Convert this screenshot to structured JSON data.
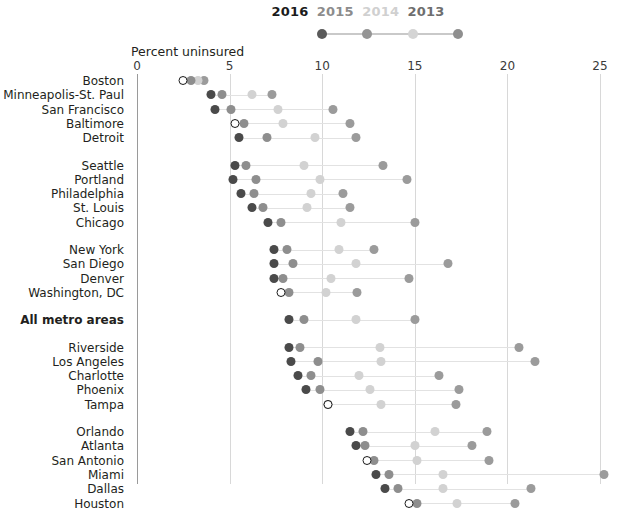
{
  "axis": {
    "title": "Percent uninsured",
    "ticks": [
      0,
      5,
      10,
      15,
      20,
      25
    ],
    "tick_labels": [
      "0",
      "5",
      "10",
      "15",
      "20",
      "25"
    ],
    "xlim": [
      0,
      25
    ]
  },
  "legend": {
    "items": [
      {
        "label": "2016",
        "color": "#5a5a5a",
        "label_color": "#1b1b1b"
      },
      {
        "label": "2015",
        "color": "#959595",
        "label_color": "#8c8c8c"
      },
      {
        "label": "2014",
        "color": "#d4d4d4",
        "label_color": "#d0d0d0"
      },
      {
        "label": "2013",
        "color": "#8f8f8f",
        "label_color": "#6e6e6e"
      }
    ],
    "track_color": "#c9c9c9"
  },
  "series_colors": {
    "2016": "#4a4a4a",
    "2015": "#8e8e8e",
    "2014": "#d2d2d2",
    "2013": "#9b9b9b"
  },
  "chart_data": {
    "type": "scatter",
    "title": "Percent uninsured",
    "xlabel": "Percent uninsured",
    "ylabel": "",
    "xlim": [
      0,
      25
    ],
    "xticks": [
      0,
      5,
      10,
      15,
      20,
      25
    ],
    "grid": true,
    "legend_position": "top",
    "series_names": [
      "2016",
      "2015",
      "2014",
      "2013"
    ],
    "groups": [
      {
        "rows": [
          {
            "category": "Boston",
            "bold": false,
            "hollow_2016": true,
            "values": {
              "2016": 2.5,
              "2015": 2.9,
              "2014": 3.3,
              "2013": 3.6
            }
          },
          {
            "category": "Minneapolis-St. Paul",
            "bold": false,
            "hollow_2016": false,
            "values": {
              "2016": 4.0,
              "2015": 4.6,
              "2014": 6.2,
              "2013": 7.3
            }
          },
          {
            "category": "San Francisco",
            "bold": false,
            "hollow_2016": false,
            "values": {
              "2016": 4.2,
              "2015": 5.1,
              "2014": 7.6,
              "2013": 10.6
            }
          },
          {
            "category": "Baltimore",
            "bold": false,
            "hollow_2016": true,
            "values": {
              "2016": 5.3,
              "2015": 5.8,
              "2014": 7.9,
              "2013": 11.5
            }
          },
          {
            "category": "Detroit",
            "bold": false,
            "hollow_2016": false,
            "values": {
              "2016": 5.5,
              "2015": 7.0,
              "2014": 9.6,
              "2013": 11.8
            }
          }
        ]
      },
      {
        "rows": [
          {
            "category": "Seattle",
            "bold": false,
            "hollow_2016": false,
            "values": {
              "2016": 5.3,
              "2015": 5.9,
              "2014": 9.0,
              "2013": 13.3
            }
          },
          {
            "category": "Portland",
            "bold": false,
            "hollow_2016": false,
            "values": {
              "2016": 5.2,
              "2015": 6.4,
              "2014": 9.9,
              "2013": 14.6
            }
          },
          {
            "category": "Philadelphia",
            "bold": false,
            "hollow_2016": false,
            "values": {
              "2016": 5.6,
              "2015": 6.3,
              "2014": 9.4,
              "2013": 11.1
            }
          },
          {
            "category": "St. Louis",
            "bold": false,
            "hollow_2016": false,
            "values": {
              "2016": 6.2,
              "2015": 6.8,
              "2014": 9.2,
              "2013": 11.5
            }
          },
          {
            "category": "Chicago",
            "bold": false,
            "hollow_2016": false,
            "values": {
              "2016": 7.1,
              "2015": 7.8,
              "2014": 11.0,
              "2013": 15.0
            }
          }
        ]
      },
      {
        "rows": [
          {
            "category": "New York",
            "bold": false,
            "hollow_2016": false,
            "values": {
              "2016": 7.4,
              "2015": 8.1,
              "2014": 10.9,
              "2013": 12.8
            }
          },
          {
            "category": "San Diego",
            "bold": false,
            "hollow_2016": false,
            "values": {
              "2016": 7.4,
              "2015": 8.4,
              "2014": 11.8,
              "2013": 16.8
            }
          },
          {
            "category": "Denver",
            "bold": false,
            "hollow_2016": false,
            "values": {
              "2016": 7.4,
              "2015": 7.9,
              "2014": 10.5,
              "2013": 14.7
            }
          },
          {
            "category": "Washington, DC",
            "bold": false,
            "hollow_2016": true,
            "values": {
              "2016": 7.8,
              "2015": 8.2,
              "2014": 10.2,
              "2013": 11.9
            }
          }
        ]
      },
      {
        "rows": [
          {
            "category": "All metro areas",
            "bold": true,
            "hollow_2016": false,
            "values": {
              "2016": 8.2,
              "2015": 9.0,
              "2014": 11.8,
              "2013": 15.0
            }
          }
        ]
      },
      {
        "rows": [
          {
            "category": "Riverside",
            "bold": false,
            "hollow_2016": false,
            "values": {
              "2016": 8.2,
              "2015": 8.8,
              "2014": 13.1,
              "2013": 20.6
            }
          },
          {
            "category": "Los Angeles",
            "bold": false,
            "hollow_2016": false,
            "values": {
              "2016": 8.3,
              "2015": 9.8,
              "2014": 13.2,
              "2013": 21.5
            }
          },
          {
            "category": "Charlotte",
            "bold": false,
            "hollow_2016": false,
            "values": {
              "2016": 8.7,
              "2015": 9.4,
              "2014": 12.0,
              "2013": 16.3
            }
          },
          {
            "category": "Phoenix",
            "bold": false,
            "hollow_2016": false,
            "values": {
              "2016": 9.1,
              "2015": 9.9,
              "2014": 12.6,
              "2013": 17.4
            }
          },
          {
            "category": "Tampa",
            "bold": false,
            "hollow_2016": true,
            "values": {
              "2016": 10.3,
              "2015": 10.3,
              "2014": 13.2,
              "2013": 17.2
            }
          }
        ]
      },
      {
        "rows": [
          {
            "category": "Orlando",
            "bold": false,
            "hollow_2016": false,
            "values": {
              "2016": 11.5,
              "2015": 12.2,
              "2014": 16.1,
              "2013": 18.9
            }
          },
          {
            "category": "Atlanta",
            "bold": false,
            "hollow_2016": false,
            "values": {
              "2016": 11.8,
              "2015": 12.3,
              "2014": 15.0,
              "2013": 18.1
            }
          },
          {
            "category": "San Antonio",
            "bold": false,
            "hollow_2016": true,
            "values": {
              "2016": 12.4,
              "2015": 12.8,
              "2014": 15.1,
              "2013": 19.0
            }
          },
          {
            "category": "Miami",
            "bold": false,
            "hollow_2016": false,
            "values": {
              "2016": 12.9,
              "2015": 13.6,
              "2014": 16.5,
              "2013": 25.2
            }
          },
          {
            "category": "Dallas",
            "bold": false,
            "hollow_2016": false,
            "values": {
              "2016": 13.4,
              "2015": 14.1,
              "2014": 16.5,
              "2013": 21.3
            }
          },
          {
            "category": "Houston",
            "bold": false,
            "hollow_2016": true,
            "values": {
              "2016": 14.7,
              "2015": 15.1,
              "2014": 17.3,
              "2013": 20.4
            }
          }
        ]
      }
    ]
  }
}
